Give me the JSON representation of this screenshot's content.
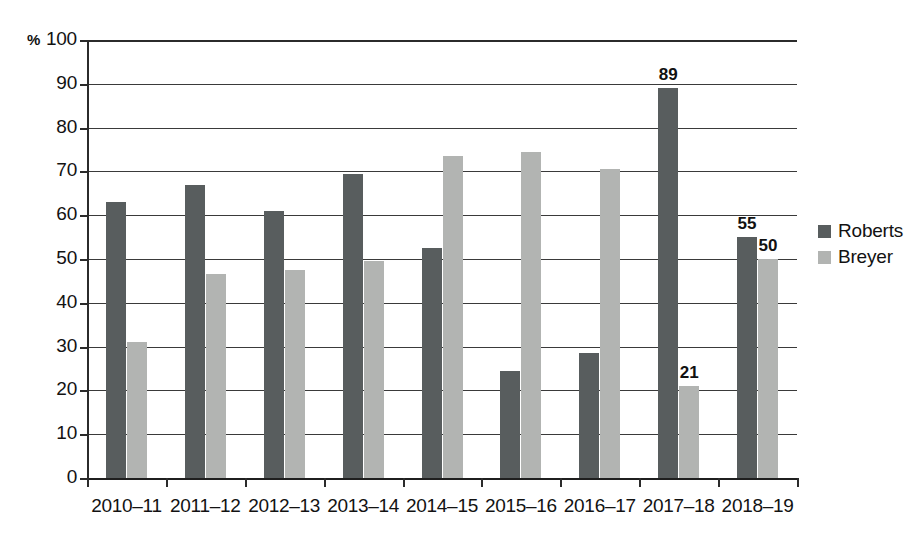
{
  "chart_data": {
    "type": "bar",
    "title": "",
    "subtitle": "",
    "xlabel": "",
    "ylabel": "%",
    "ylim": [
      0,
      100
    ],
    "ytick_step": 10,
    "yticks": [
      "100",
      "90",
      "80",
      "70",
      "60",
      "50",
      "40",
      "30",
      "20",
      "10",
      "0"
    ],
    "grid": true,
    "legend_position": "right",
    "categories": [
      "2010–11",
      "2011–12",
      "2012–13",
      "2013–14",
      "2014–15",
      "2015–16",
      "2016–17",
      "2017–18",
      "2018–19"
    ],
    "series": [
      {
        "name": "Roberts",
        "color": "#585d5e",
        "values": [
          63,
          67,
          61,
          69.5,
          52.5,
          24.5,
          28.5,
          89,
          55
        ],
        "labels": [
          "",
          "",
          "",
          "",
          "",
          "",
          "",
          "89",
          "55"
        ]
      },
      {
        "name": "Breyer",
        "color": "#b2b4b2",
        "values": [
          31,
          46.5,
          47.5,
          49.5,
          73.5,
          74.5,
          70.5,
          21,
          50
        ],
        "labels": [
          "",
          "",
          "",
          "",
          "",
          "",
          "",
          "21",
          "50"
        ]
      }
    ]
  },
  "legend": {
    "items": [
      {
        "label": "Roberts",
        "color": "#585d5e"
      },
      {
        "label": "Breyer",
        "color": "#b2b4b2"
      }
    ]
  },
  "axis": {
    "y_unit_symbol": "%"
  }
}
